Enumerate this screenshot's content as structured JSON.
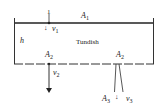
{
  "diagram": {
    "title": "Tundish",
    "labels": {
      "tundish": "Tundish",
      "height": "h",
      "surface_area": {
        "base": "A",
        "sub": "1"
      },
      "outlet_area_left": {
        "base": "A",
        "sub": "2"
      },
      "outlet_area_right": {
        "base": "A",
        "sub": "2"
      },
      "nozzle_area": {
        "base": "A",
        "sub": "3"
      },
      "v1": {
        "base": "v",
        "sub": "1"
      },
      "v2": {
        "base": "v",
        "sub": "2"
      },
      "v3": {
        "base": "v",
        "sub": "3"
      },
      "point_1": "1",
      "down_arrow_small": "↓"
    },
    "colors": {
      "line": "#222222",
      "background": "#ffffff"
    }
  }
}
